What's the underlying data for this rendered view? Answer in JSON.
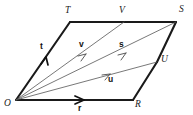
{
  "figure": {
    "background_color": "#ffffff",
    "stroke_color": "#1a1a1a",
    "thin_stroke_color": "#4a4a4a",
    "width": 193,
    "height": 115
  },
  "points": [
    {
      "name": "O",
      "label": "O",
      "x": 16,
      "y": 100,
      "label_x": 4,
      "label_y": 106
    },
    {
      "name": "T",
      "label": "T",
      "x": 70,
      "y": 22,
      "label_x": 65,
      "label_y": 13
    },
    {
      "name": "V",
      "label": "V",
      "x": 124,
      "y": 22,
      "label_x": 119,
      "label_y": 13
    },
    {
      "name": "S",
      "label": "S",
      "x": 176,
      "y": 22,
      "label_x": 179,
      "label_y": 12
    },
    {
      "name": "U",
      "label": "U",
      "x": 157,
      "y": 62,
      "label_x": 161,
      "label_y": 62
    },
    {
      "name": "R",
      "label": "R",
      "x": 133,
      "y": 100,
      "label_x": 135,
      "label_y": 107
    }
  ],
  "vectors": [
    {
      "name": "t",
      "label": "t",
      "from": "O",
      "to": "T",
      "label_x": 40,
      "label_y": 49,
      "arrow_x": 46,
      "arrow_y": 57,
      "weight": "bold"
    },
    {
      "name": "v",
      "label": "v",
      "from": "O",
      "to": "V",
      "label_x": 79,
      "label_y": 47,
      "arrow_x": 84,
      "arrow_y": 55,
      "weight": "thin"
    },
    {
      "name": "s",
      "label": "s",
      "from": "O",
      "to": "S",
      "label_x": 119,
      "label_y": 47,
      "arrow_x": 123,
      "arrow_y": 55,
      "weight": "thin"
    },
    {
      "name": "u",
      "label": "u",
      "from": "O",
      "to": "U",
      "label_x": 108,
      "label_y": 82,
      "arrow_x": 106,
      "arrow_y": 74,
      "weight": "thin"
    },
    {
      "name": "r",
      "label": "r",
      "from": "O",
      "to": "R",
      "label_x": 78,
      "label_y": 111,
      "arrow_x": 79,
      "arrow_y": 100,
      "weight": "bold"
    }
  ],
  "edges": [
    {
      "name": "edge-O-T",
      "from": "O",
      "to": "T",
      "weight": "bold"
    },
    {
      "name": "edge-T-V",
      "from": "T",
      "to": "V",
      "weight": "bold"
    },
    {
      "name": "edge-V-S",
      "from": "V",
      "to": "S",
      "weight": "bold"
    },
    {
      "name": "edge-S-U",
      "from": "S",
      "to": "U",
      "weight": "bold"
    },
    {
      "name": "edge-U-R",
      "from": "U",
      "to": "R",
      "weight": "bold"
    },
    {
      "name": "edge-O-R",
      "from": "O",
      "to": "R",
      "weight": "bold"
    },
    {
      "name": "ray-O-V",
      "from": "O",
      "to": "V",
      "weight": "thin"
    },
    {
      "name": "ray-O-S",
      "from": "O",
      "to": "S",
      "weight": "thin"
    },
    {
      "name": "ray-O-U",
      "from": "O",
      "to": "U",
      "weight": "thin"
    }
  ]
}
